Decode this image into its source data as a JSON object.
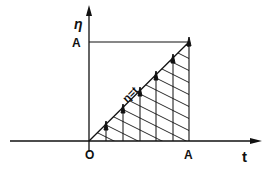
{
  "diagram": {
    "axes": {
      "y_label": "η",
      "x_label": "t",
      "origin_label": "O",
      "y_tick_label": "A",
      "x_tick_label": "A"
    },
    "line_label": "η = t",
    "line_label_text": "η=t",
    "colors": {
      "stroke": "#111111",
      "background": "#ffffff"
    },
    "arrow_count": 6
  }
}
